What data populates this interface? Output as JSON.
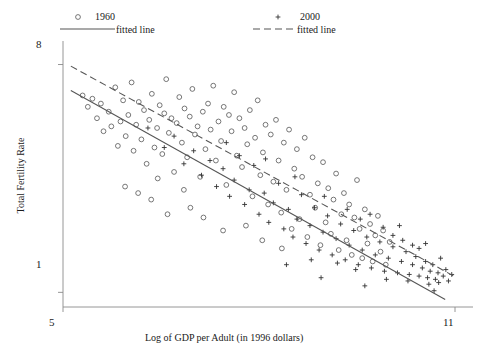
{
  "chart_data": {
    "type": "scatter",
    "title": "",
    "xlabel": "Log of GDP per Adult (in 1996 dollars)",
    "ylabel": "Total Fertility Rate",
    "xlim": [
      5,
      11
    ],
    "ylim": [
      0.55,
      8.6
    ],
    "xticks": [
      "5",
      "11"
    ],
    "yticks": [
      "8",
      "1"
    ],
    "ytick_values": [
      8,
      1
    ],
    "xtick_values": [
      5,
      11
    ],
    "grid": false,
    "legend_position": "top",
    "series": [
      {
        "name": "1960",
        "marker": "open-circle",
        "color": "#555555",
        "points": [
          [
            5.3,
            7.05
          ],
          [
            5.38,
            6.7
          ],
          [
            5.45,
            6.95
          ],
          [
            5.52,
            6.35
          ],
          [
            5.58,
            6.8
          ],
          [
            5.62,
            5.95
          ],
          [
            5.7,
            6.55
          ],
          [
            5.74,
            6.1
          ],
          [
            5.8,
            7.3
          ],
          [
            5.84,
            5.5
          ],
          [
            5.88,
            6.25
          ],
          [
            5.92,
            6.9
          ],
          [
            5.96,
            5.8
          ],
          [
            6.0,
            6.45
          ],
          [
            6.05,
            7.45
          ],
          [
            6.08,
            5.35
          ],
          [
            6.12,
            6.15
          ],
          [
            6.16,
            6.85
          ],
          [
            6.2,
            5.7
          ],
          [
            6.24,
            6.6
          ],
          [
            6.28,
            4.95
          ],
          [
            6.32,
            6.3
          ],
          [
            6.36,
            7.1
          ],
          [
            6.4,
            5.45
          ],
          [
            6.44,
            6.05
          ],
          [
            6.48,
            6.75
          ],
          [
            6.52,
            5.25
          ],
          [
            6.55,
            6.5
          ],
          [
            6.58,
            7.55
          ],
          [
            6.62,
            5.9
          ],
          [
            6.66,
            6.35
          ],
          [
            6.7,
            4.7
          ],
          [
            6.74,
            6.2
          ],
          [
            6.78,
            7.0
          ],
          [
            6.82,
            5.6
          ],
          [
            6.86,
            6.65
          ],
          [
            6.9,
            5.15
          ],
          [
            6.94,
            6.4
          ],
          [
            6.98,
            7.25
          ],
          [
            7.02,
            5.85
          ],
          [
            7.06,
            6.1
          ],
          [
            7.1,
            4.55
          ],
          [
            7.14,
            6.55
          ],
          [
            7.18,
            5.4
          ],
          [
            7.22,
            6.8
          ],
          [
            7.26,
            6.0
          ],
          [
            7.3,
            7.35
          ],
          [
            7.34,
            5.05
          ],
          [
            7.38,
            6.25
          ],
          [
            7.42,
            5.65
          ],
          [
            7.46,
            6.7
          ],
          [
            7.5,
            4.3
          ],
          [
            7.54,
            6.45
          ],
          [
            7.58,
            5.95
          ],
          [
            7.62,
            7.15
          ],
          [
            7.66,
            5.2
          ],
          [
            7.7,
            6.35
          ],
          [
            7.74,
            4.85
          ],
          [
            7.78,
            6.05
          ],
          [
            7.82,
            5.55
          ],
          [
            7.86,
            6.6
          ],
          [
            7.9,
            3.95
          ],
          [
            7.94,
            5.75
          ],
          [
            7.98,
            6.9
          ],
          [
            8.02,
            4.6
          ],
          [
            8.06,
            5.3
          ],
          [
            8.1,
            6.15
          ],
          [
            8.14,
            3.7
          ],
          [
            8.18,
            5.85
          ],
          [
            8.22,
            4.4
          ],
          [
            8.26,
            6.3
          ],
          [
            8.3,
            5.05
          ],
          [
            8.34,
            3.45
          ],
          [
            8.38,
            5.6
          ],
          [
            8.42,
            4.15
          ],
          [
            8.46,
            6.0
          ],
          [
            8.5,
            2.95
          ],
          [
            8.54,
            4.8
          ],
          [
            8.58,
            5.4
          ],
          [
            8.62,
            3.25
          ],
          [
            8.66,
            4.55
          ],
          [
            8.7,
            5.75
          ],
          [
            8.74,
            2.7
          ],
          [
            8.78,
            4.0
          ],
          [
            8.82,
            5.15
          ],
          [
            8.86,
            3.6
          ],
          [
            8.9,
            4.35
          ],
          [
            8.94,
            2.45
          ],
          [
            8.98,
            5.0
          ],
          [
            9.02,
            3.15
          ],
          [
            9.06,
            4.2
          ],
          [
            9.1,
            2.8
          ],
          [
            9.14,
            3.85
          ],
          [
            9.18,
            4.65
          ],
          [
            9.22,
            2.3
          ],
          [
            9.26,
            3.4
          ],
          [
            9.3,
            4.05
          ],
          [
            9.34,
            2.6
          ],
          [
            9.38,
            3.7
          ],
          [
            9.42,
            2.15
          ],
          [
            9.46,
            3.3
          ],
          [
            9.5,
            4.45
          ],
          [
            9.54,
            2.95
          ],
          [
            9.58,
            2.05
          ],
          [
            9.62,
            3.55
          ],
          [
            9.66,
            2.5
          ],
          [
            9.7,
            3.1
          ],
          [
            9.74,
            1.95
          ],
          [
            9.78,
            2.75
          ],
          [
            9.82,
            3.35
          ],
          [
            9.86,
            2.25
          ],
          [
            9.9,
            2.9
          ],
          [
            9.94,
            1.85
          ],
          [
            10.0,
            2.55
          ],
          [
            6.35,
            3.85
          ],
          [
            6.6,
            3.4
          ],
          [
            6.95,
            3.6
          ],
          [
            7.15,
            3.3
          ],
          [
            7.45,
            2.9
          ],
          [
            7.8,
            3.05
          ],
          [
            8.05,
            2.6
          ],
          [
            8.35,
            2.35
          ],
          [
            5.95,
            4.25
          ],
          [
            6.15,
            4.05
          ],
          [
            6.45,
            4.5
          ],
          [
            6.85,
            4.15
          ]
        ]
      },
      {
        "name": "2000",
        "marker": "plus",
        "color": "#333333",
        "points": [
          [
            6.3,
            6.05
          ],
          [
            6.55,
            5.45
          ],
          [
            6.7,
            5.8
          ],
          [
            6.85,
            4.95
          ],
          [
            7.0,
            5.35
          ],
          [
            7.12,
            4.6
          ],
          [
            7.25,
            5.05
          ],
          [
            7.35,
            4.25
          ],
          [
            7.45,
            4.8
          ],
          [
            7.55,
            3.95
          ],
          [
            7.62,
            4.45
          ],
          [
            7.7,
            5.2
          ],
          [
            7.78,
            3.7
          ],
          [
            7.85,
            4.15
          ],
          [
            7.92,
            4.9
          ],
          [
            8.0,
            3.4
          ],
          [
            8.08,
            4.05
          ],
          [
            8.15,
            3.15
          ],
          [
            8.22,
            3.75
          ],
          [
            8.3,
            4.35
          ],
          [
            8.38,
            2.95
          ],
          [
            8.45,
            3.55
          ],
          [
            8.52,
            2.7
          ],
          [
            8.58,
            3.25
          ],
          [
            8.65,
            4.0
          ],
          [
            8.72,
            2.5
          ],
          [
            8.78,
            3.05
          ],
          [
            8.85,
            3.6
          ],
          [
            8.92,
            2.3
          ],
          [
            8.98,
            2.85
          ],
          [
            9.05,
            3.35
          ],
          [
            9.12,
            2.15
          ],
          [
            9.18,
            2.65
          ],
          [
            9.25,
            3.1
          ],
          [
            9.32,
            2.0
          ],
          [
            9.38,
            2.45
          ],
          [
            9.45,
            2.9
          ],
          [
            9.52,
            1.85
          ],
          [
            9.58,
            2.3
          ],
          [
            9.65,
            2.7
          ],
          [
            9.72,
            1.75
          ],
          [
            9.78,
            2.15
          ],
          [
            9.85,
            2.55
          ],
          [
            9.92,
            1.65
          ],
          [
            9.98,
            2.05
          ],
          [
            10.05,
            2.4
          ],
          [
            10.12,
            1.6
          ],
          [
            10.18,
            1.95
          ],
          [
            10.25,
            2.25
          ],
          [
            10.3,
            1.55
          ],
          [
            10.35,
            1.85
          ],
          [
            10.4,
            2.1
          ],
          [
            10.45,
            1.5
          ],
          [
            10.5,
            1.75
          ],
          [
            10.55,
            1.95
          ],
          [
            10.58,
            1.45
          ],
          [
            10.62,
            1.65
          ],
          [
            10.66,
            1.85
          ],
          [
            10.7,
            1.4
          ],
          [
            10.74,
            1.6
          ],
          [
            10.78,
            2.05
          ],
          [
            10.82,
            1.5
          ],
          [
            10.86,
            1.7
          ],
          [
            10.9,
            1.35
          ],
          [
            10.95,
            1.55
          ],
          [
            10.45,
            2.35
          ],
          [
            10.2,
            2.6
          ],
          [
            9.9,
            3.0
          ],
          [
            10.6,
            1.25
          ],
          [
            10.75,
            1.3
          ],
          [
            9.35,
            3.55
          ],
          [
            9.0,
            3.95
          ],
          [
            8.55,
            4.55
          ],
          [
            8.1,
            5.1
          ],
          [
            7.5,
            5.6
          ],
          [
            9.55,
            3.25
          ],
          [
            10.05,
            2.75
          ],
          [
            10.35,
            2.45
          ],
          [
            8.8,
            2.0
          ],
          [
            9.2,
            1.9
          ],
          [
            9.48,
            1.7
          ],
          [
            9.7,
            3.4
          ],
          [
            10.15,
            3.05
          ],
          [
            10.55,
            2.5
          ],
          [
            9.95,
            1.4
          ],
          [
            10.28,
            1.35
          ],
          [
            10.68,
            1.05
          ],
          [
            9.62,
            1.2
          ],
          [
            8.95,
            1.45
          ],
          [
            8.42,
            1.85
          ]
        ]
      }
    ],
    "fitted_lines": [
      {
        "name": "1960 fitted line",
        "style": "solid",
        "x0": 5.12,
        "y0": 7.2,
        "x1": 10.85,
        "y1": 0.78
      },
      {
        "name": "2000 fitted line",
        "style": "dashed",
        "x0": 5.12,
        "y0": 7.95,
        "x1": 11.0,
        "y1": 1.48
      }
    ]
  },
  "legend": {
    "items": [
      {
        "label_series": "1960",
        "label_line": "fitted line",
        "marker": "open-circle",
        "line_style": "solid"
      },
      {
        "label_series": "2000",
        "label_line": "fitted line",
        "marker": "plus",
        "line_style": "dashed"
      }
    ]
  },
  "colors": {
    "axis": "#8a8a8a",
    "marker_1960": "#555555",
    "marker_2000": "#333333",
    "line": "#555555",
    "text": "#1a1a1a",
    "background": "#ffffff"
  }
}
